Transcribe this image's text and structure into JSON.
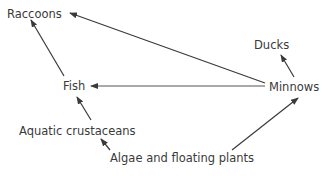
{
  "diagram": {
    "type": "food-web",
    "nodes": [
      {
        "id": "raccoons",
        "label": "Raccoons"
      },
      {
        "id": "ducks",
        "label": "Ducks"
      },
      {
        "id": "fish",
        "label": "Fish"
      },
      {
        "id": "minnows",
        "label": "Minnows"
      },
      {
        "id": "aquatic_crustaceans",
        "label": "Aquatic crustaceans"
      },
      {
        "id": "algae",
        "label": "Algae and floating plants"
      }
    ],
    "edges": [
      {
        "from": "fish",
        "to": "raccoons"
      },
      {
        "from": "minnows",
        "to": "raccoons"
      },
      {
        "from": "minnows",
        "to": "fish"
      },
      {
        "from": "minnows",
        "to": "ducks"
      },
      {
        "from": "aquatic_crustaceans",
        "to": "fish"
      },
      {
        "from": "algae",
        "to": "aquatic_crustaceans"
      },
      {
        "from": "algae",
        "to": "minnows"
      }
    ]
  }
}
